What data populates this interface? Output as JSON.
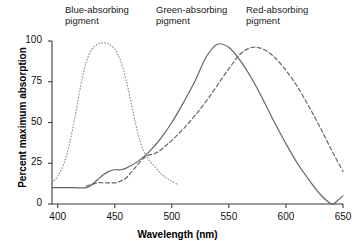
{
  "chart_data": {
    "type": "line",
    "title": "",
    "xlabel": "Wavelength (nm)",
    "ylabel": "Percent maximum absorption",
    "xlim": [
      395,
      650
    ],
    "ylim": [
      0,
      100
    ],
    "grid": false,
    "legend_position": "above-plot-annotations",
    "xticks": [
      400,
      450,
      500,
      550,
      600,
      650
    ],
    "yticks": [
      0,
      25,
      50,
      75,
      100
    ],
    "annotations": [
      {
        "name": "blue-absorbing-pigment-label",
        "text": "Blue-absorbing\npigment",
        "x": 447
      },
      {
        "name": "green-absorbing-pigment-label",
        "text": "Green-absorbing\npigment",
        "x": 525
      },
      {
        "name": "red-absorbing-pigment-label",
        "text": "Red-absorbing\npigment",
        "x": 602
      }
    ],
    "series": [
      {
        "name": "Blue-absorbing pigment",
        "style": "dotted",
        "color": "#8c8c8c",
        "peak_x": 440,
        "peak_y": 99,
        "x": [
          395,
          400,
          405,
          410,
          415,
          420,
          425,
          430,
          435,
          440,
          445,
          450,
          455,
          460,
          465,
          470,
          475,
          480,
          485,
          490,
          495,
          500,
          505
        ],
        "values": [
          13,
          17,
          24,
          36,
          53,
          72,
          87,
          95,
          98,
          99,
          98,
          95,
          88,
          76,
          60,
          44,
          33,
          27,
          23,
          19,
          16,
          14,
          12
        ]
      },
      {
        "name": "Green-absorbing pigment",
        "style": "solid",
        "color": "#666666",
        "peak_x": 540,
        "peak_y": 98,
        "x": [
          395,
          405,
          415,
          425,
          430,
          435,
          440,
          445,
          450,
          455,
          460,
          470,
          480,
          490,
          500,
          510,
          520,
          530,
          540,
          550,
          560,
          570,
          580,
          590,
          600,
          610,
          620,
          630,
          640,
          645,
          650
        ],
        "values": [
          10,
          10,
          10,
          10,
          12,
          15,
          18,
          20,
          21,
          21,
          22,
          26,
          32,
          40,
          50,
          62,
          75,
          90,
          98,
          96,
          88,
          77,
          64,
          50,
          37,
          25,
          15,
          6,
          0,
          2,
          5
        ]
      },
      {
        "name": "Red-absorbing pigment",
        "style": "dashed",
        "color": "#666666",
        "peak_x": 570,
        "peak_y": 96,
        "x": [
          425,
          430,
          435,
          440,
          445,
          450,
          455,
          460,
          465,
          470,
          475,
          480,
          485,
          490,
          495,
          500,
          510,
          520,
          530,
          540,
          550,
          560,
          570,
          580,
          590,
          600,
          610,
          620,
          630,
          640,
          650
        ],
        "values": [
          11,
          12,
          13,
          13,
          13,
          13,
          14,
          16,
          20,
          24,
          28,
          30,
          31,
          33,
          36,
          39,
          46,
          54,
          63,
          73,
          83,
          92,
          96,
          95,
          90,
          82,
          72,
          60,
          47,
          33,
          20
        ]
      }
    ]
  },
  "axes": {
    "x_title": "Wavelength (nm)",
    "y_title": "Percent maximum absorption",
    "x_tick_labels": [
      "400",
      "450",
      "500",
      "550",
      "600",
      "650"
    ],
    "y_tick_labels": [
      "0",
      "25",
      "50",
      "75",
      "100"
    ]
  }
}
